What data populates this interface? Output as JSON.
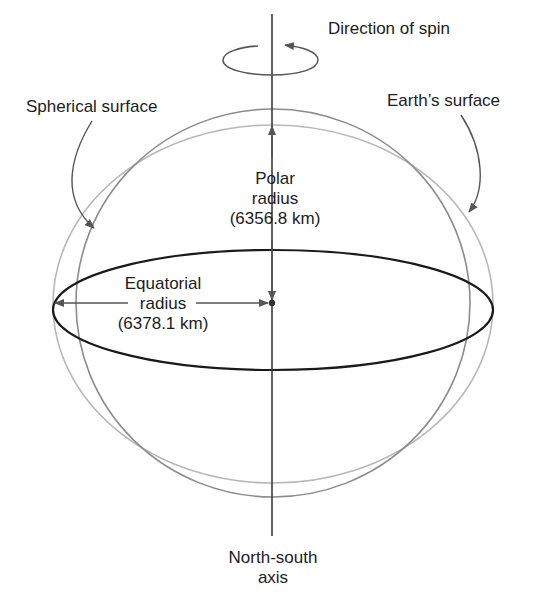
{
  "diagram": {
    "labels": {
      "direction_of_spin": "Direction of spin",
      "spherical_surface": "Spherical surface",
      "earths_surface": "Earth’s surface",
      "polar_radius_line1": "Polar",
      "polar_radius_line2": "radius",
      "polar_radius_value": "(6356.8 km)",
      "equatorial_radius_line1": "Equatorial",
      "equatorial_radius_line2": "radius",
      "equatorial_radius_value": "(6378.1 km)",
      "axis_line1": "North-south",
      "axis_line2": "axis"
    },
    "values": {
      "polar_radius_km": 6356.8,
      "equatorial_radius_km": 6378.1
    },
    "colors": {
      "equator": "#1a1a1a",
      "spherical_surface": "#8a8a8a",
      "earths_surface": "#b4b4b4",
      "axis": "#3a3a3a",
      "arrows": "#555555"
    }
  }
}
